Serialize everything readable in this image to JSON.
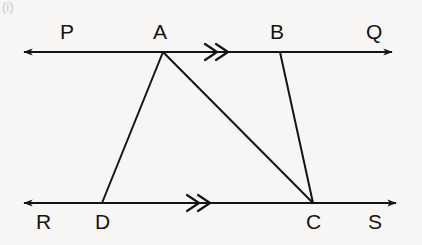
{
  "figure": {
    "kind": "geometry-diagram",
    "caption_artifact": "(i)",
    "background_color": "#f7f6f4",
    "stroke_color": "#141414",
    "stroke_width": 2,
    "width": 422,
    "height": 245,
    "labels": {
      "p": "P",
      "a": "A",
      "b": "B",
      "q": "Q",
      "r": "R",
      "d": "D",
      "c": "C",
      "s": "S"
    },
    "points": {
      "A": {
        "x": 163,
        "y": 52
      },
      "B": {
        "x": 280,
        "y": 52
      },
      "C": {
        "x": 313,
        "y": 203
      },
      "D": {
        "x": 102,
        "y": 203
      }
    },
    "lines": [
      {
        "name": "line-PQ",
        "from_label": "P",
        "to_label": "Q",
        "x1": 24,
        "y1": 52,
        "x2": 392,
        "y2": 52,
        "double_arrow": true,
        "tick_marks": 2
      },
      {
        "name": "line-RS",
        "from_label": "R",
        "to_label": "S",
        "x1": 24,
        "y1": 203,
        "x2": 396,
        "y2": 203,
        "double_arrow": true,
        "tick_marks": 2
      }
    ],
    "segments": [
      {
        "name": "segment-AD",
        "x1": 163,
        "y1": 52,
        "x2": 102,
        "y2": 203
      },
      {
        "name": "segment-AC",
        "x1": 163,
        "y1": 52,
        "x2": 313,
        "y2": 203
      },
      {
        "name": "segment-BC",
        "x1": 280,
        "y1": 52,
        "x2": 313,
        "y2": 203
      }
    ],
    "label_positions": {
      "p": {
        "x": 60,
        "y": 21
      },
      "a": {
        "x": 153,
        "y": 21
      },
      "b": {
        "x": 270,
        "y": 21
      },
      "q": {
        "x": 366,
        "y": 21
      },
      "r": {
        "x": 36,
        "y": 211
      },
      "d": {
        "x": 95,
        "y": 211
      },
      "c": {
        "x": 306,
        "y": 211
      },
      "s": {
        "x": 368,
        "y": 211
      }
    },
    "parallel_ticks": [
      {
        "name": "tick-mark-top",
        "cx": 217,
        "cy": 52
      },
      {
        "name": "tick-mark-bottom",
        "cx": 199,
        "cy": 203
      }
    ]
  }
}
